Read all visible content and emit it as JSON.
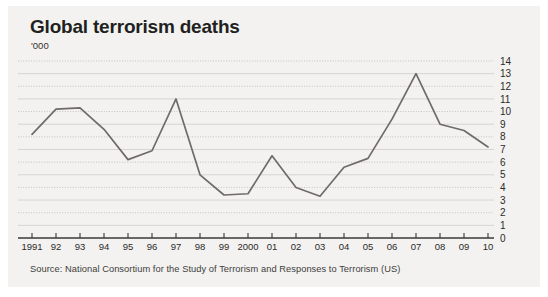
{
  "card": {
    "background": "#f3f2f0"
  },
  "header": {
    "title": "Global terrorism deaths",
    "subtitle": "'000"
  },
  "footer": {
    "source": "Source: National Consortium for the Study of Terrorism and Responses to Terrorism (US)"
  },
  "chart_data": {
    "type": "line",
    "title": "Global terrorism deaths",
    "subtitle": "'000",
    "xlabel": "",
    "ylabel": "",
    "units": "thousands",
    "grid": true,
    "legend": false,
    "legend_position": "none",
    "line_color": "#6e6b68",
    "ylim": [
      0,
      14
    ],
    "yticks": [
      0,
      1,
      2,
      3,
      4,
      5,
      6,
      7,
      8,
      9,
      10,
      11,
      12,
      13,
      14
    ],
    "ytick_labels": [
      "0",
      "1",
      "2",
      "3",
      "4",
      "5",
      "6",
      "7",
      "8",
      "9",
      "10",
      "11",
      "12",
      "13",
      "14"
    ],
    "categories": [
      "1991",
      "92",
      "93",
      "94",
      "95",
      "96",
      "97",
      "98",
      "99",
      "2000",
      "01",
      "02",
      "03",
      "04",
      "05",
      "06",
      "07",
      "08",
      "09",
      "10"
    ],
    "x": [
      1991,
      1992,
      1993,
      1994,
      1995,
      1996,
      1997,
      1998,
      1999,
      2000,
      2001,
      2002,
      2003,
      2004,
      2005,
      2006,
      2007,
      2008,
      2009,
      2010
    ],
    "values": [
      8.2,
      10.2,
      10.3,
      8.6,
      6.2,
      6.9,
      11.0,
      5.0,
      3.4,
      3.5,
      6.5,
      4.0,
      3.3,
      5.6,
      6.3,
      9.4,
      13.0,
      9.0,
      8.5,
      7.2
    ],
    "series": [
      {
        "name": "Global terrorism deaths",
        "values": [
          8.2,
          10.2,
          10.3,
          8.6,
          6.2,
          6.9,
          11.0,
          5.0,
          3.4,
          3.5,
          6.5,
          4.0,
          3.3,
          5.6,
          6.3,
          9.4,
          13.0,
          9.0,
          8.5,
          7.2
        ]
      }
    ]
  }
}
